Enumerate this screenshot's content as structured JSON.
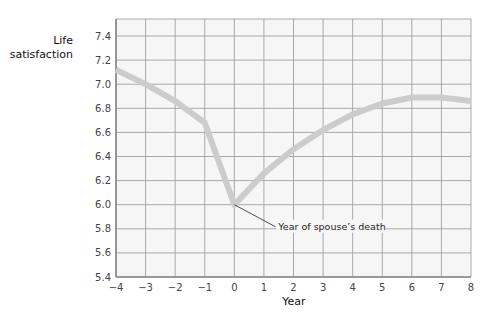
{
  "chart_data": {
    "type": "line",
    "title": "",
    "xlabel": "Year",
    "ylabel_lines": [
      "Life",
      "satisfaction"
    ],
    "xlim": [
      -4,
      8
    ],
    "ylim": [
      5.4,
      7.4
    ],
    "xticks": [
      -4,
      -3,
      -2,
      -1,
      0,
      1,
      2,
      3,
      4,
      5,
      6,
      7,
      8
    ],
    "xtick_labels": [
      "−4",
      "−3",
      "−2",
      "−1",
      "0",
      "1",
      "2",
      "3",
      "4",
      "5",
      "6",
      "7",
      "8"
    ],
    "yticks": [
      5.4,
      5.6,
      5.8,
      6.0,
      6.2,
      6.4,
      6.6,
      6.8,
      7.0,
      7.2,
      7.4
    ],
    "ytick_labels": [
      "5.4",
      "5.6",
      "5.8",
      "6.0",
      "6.2",
      "6.4",
      "6.6",
      "6.8",
      "7.0",
      "7.2",
      "7.4"
    ],
    "grid": true,
    "series": [
      {
        "name": "Life satisfaction",
        "color": "#cccccc",
        "x": [
          -4,
          -3,
          -2,
          -1,
          0,
          1,
          2,
          3,
          4,
          5,
          6,
          7,
          8
        ],
        "y": [
          7.12,
          7.0,
          6.86,
          6.68,
          6.0,
          6.26,
          6.46,
          6.62,
          6.75,
          6.84,
          6.89,
          6.89,
          6.86
        ]
      }
    ],
    "annotations": [
      {
        "text": "Year of spouse’s death",
        "x": 0,
        "y": 6.0
      }
    ],
    "colors": {
      "plot_background": "#f6f6f6",
      "grid": "#a0a0a0",
      "axis": "#888888",
      "line": "#cccccc"
    }
  }
}
